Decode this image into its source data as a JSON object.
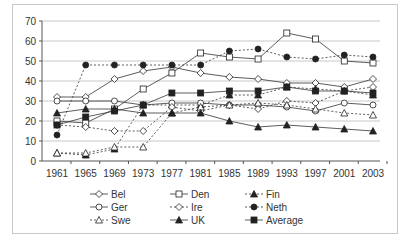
{
  "chart_data": {
    "type": "line",
    "title": "",
    "xlabel": "",
    "ylabel": "",
    "ylim": [
      0,
      70
    ],
    "yticks": [
      0,
      10,
      20,
      30,
      40,
      50,
      60,
      70
    ],
    "grid": true,
    "legend_position": "bottom",
    "x": [
      "1961",
      "1965",
      "1969",
      "1973",
      "1977",
      "1981",
      "1985",
      "1989",
      "1993",
      "1997",
      "2001",
      "2003"
    ],
    "series": [
      {
        "name": "Bel",
        "marker": "diamond-open",
        "dash": false,
        "values": [
          32,
          32,
          41,
          45,
          47,
          44,
          42,
          41,
          39,
          39,
          37,
          41
        ]
      },
      {
        "name": "Den",
        "marker": "square-open",
        "dash": false,
        "values": [
          20,
          19,
          26,
          36,
          44,
          54,
          52,
          51,
          64,
          61,
          50,
          49
        ]
      },
      {
        "name": "Fin",
        "marker": "triangle-filled",
        "dash": true,
        "values": [
          4,
          3,
          6,
          28,
          28,
          28,
          33,
          33,
          37,
          36,
          35,
          33
        ]
      },
      {
        "name": "Ger",
        "marker": "circle-open",
        "dash": false,
        "values": [
          30,
          30,
          30,
          28,
          29,
          29,
          28,
          28,
          27,
          25,
          29,
          28
        ]
      },
      {
        "name": "Ire",
        "marker": "diamond-open",
        "dash": true,
        "values": [
          18,
          17,
          15,
          15,
          27,
          25,
          28,
          26,
          30,
          29,
          35,
          37
        ]
      },
      {
        "name": "Neth",
        "marker": "circle-filled",
        "dash": true,
        "values": [
          13,
          48,
          48,
          48,
          48,
          48,
          55,
          56,
          52,
          51,
          53,
          52
        ]
      },
      {
        "name": "Swe",
        "marker": "triangle-open",
        "dash": true,
        "values": [
          4,
          4,
          7,
          7,
          24,
          27,
          28,
          29,
          28,
          26,
          24,
          23
        ]
      },
      {
        "name": "UK",
        "marker": "triangle-filled",
        "dash": false,
        "values": [
          24,
          26,
          26,
          24,
          24,
          24,
          20,
          17,
          18,
          17,
          16,
          15
        ]
      },
      {
        "name": "Average",
        "marker": "square-filled",
        "dash": false,
        "values": [
          18,
          22,
          25,
          28,
          34,
          34,
          35,
          35,
          37,
          35,
          35,
          34
        ]
      }
    ]
  },
  "legend": {
    "items": [
      "Bel",
      "Den",
      "Fin",
      "Ger",
      "Ire",
      "Neth",
      "Swe",
      "UK",
      "Average"
    ]
  }
}
